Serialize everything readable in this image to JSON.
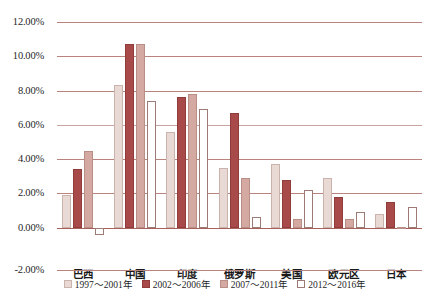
{
  "chart_data": {
    "type": "bar",
    "title": "",
    "xlabel": "",
    "ylabel": "",
    "ylim": [
      -2,
      12
    ],
    "ytick_labels": [
      "12.00%",
      "10.00%",
      "8.00%",
      "6.00%",
      "4.00%",
      "2.00%",
      "0.00%",
      "-2.00%"
    ],
    "ytick_values": [
      12,
      10,
      8,
      6,
      4,
      2,
      0,
      -2
    ],
    "grid": true,
    "legend_position": "bottom-center",
    "categories": [
      "巴西",
      "中国",
      "印度",
      "俄罗斯",
      "美国",
      "欧元区",
      "日本"
    ],
    "series": [
      {
        "name": "1997～2001年",
        "color": "#e9d9d4",
        "values": [
          1.9,
          8.3,
          5.6,
          3.5,
          3.7,
          2.9,
          0.8
        ]
      },
      {
        "name": "2002～2006年",
        "color": "#a84a49",
        "values": [
          3.4,
          10.7,
          7.6,
          6.7,
          2.8,
          1.8,
          1.5
        ]
      },
      {
        "name": "2007～2011年",
        "color": "#d4a9a1",
        "values": [
          4.5,
          10.7,
          7.8,
          2.9,
          0.5,
          0.5,
          0.05
        ]
      },
      {
        "name": "2012～2016年",
        "color": "#ffffff",
        "values": [
          -0.4,
          7.4,
          6.9,
          0.6,
          2.2,
          0.9,
          1.2
        ]
      }
    ]
  }
}
